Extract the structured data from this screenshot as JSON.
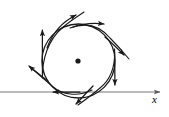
{
  "figure": {
    "title": "",
    "background_color": "#ffffff",
    "stroke_color": "#1a1a1a",
    "width": 169,
    "height": 117
  },
  "axis": {
    "x_label": "x",
    "x_label_position": {
      "x": 152,
      "y": 94
    },
    "line": {
      "x1": 0,
      "y1": 92,
      "x2": 160,
      "y2": 92
    },
    "arrow_tip": {
      "x": 160,
      "y": 92
    },
    "stroke_width": 1
  },
  "equilibrium_point": {
    "name": "center-dot",
    "cx": 78,
    "cy": 61,
    "r": 2.6
  },
  "limit_cycle": {
    "name": "circle",
    "cx": 78.5,
    "cy": 61,
    "rx": 36.5,
    "ry": 37,
    "stroke_width": 1.3
  },
  "trajectories": [
    {
      "name": "arrow-up-left-vertical",
      "direction": "up",
      "path": "M 42.5 74 C 42.3 62 42.4 44 42.4 30",
      "tip": {
        "x": 42.4,
        "y": 24
      },
      "angle_deg": -90
    },
    {
      "name": "arrow-up-right-diagonal",
      "direction": "up-right",
      "path": "M 47 48 C 52 34 62 22 76 15",
      "tip": {
        "x": 85,
        "y": 10
      },
      "angle_deg": -29
    },
    {
      "name": "arrow-right-horizontal-top",
      "direction": "right",
      "path": "M 73 27 C 85 23 95 23 104 24",
      "tip": {
        "x": 113,
        "y": 24
      },
      "angle_deg": 0
    },
    {
      "name": "arrow-down-right-diagonal",
      "direction": "down-right",
      "path": "M 105 37 C 112 43 118 49 124 55",
      "tip": {
        "x": 131,
        "y": 61
      },
      "angle_deg": 41
    },
    {
      "name": "arrow-down-vertical-right",
      "direction": "down",
      "path": "M 114.5 49 C 114.8 62 114.9 76 114.9 85",
      "tip": {
        "x": 114.9,
        "y": 92
      },
      "angle_deg": 90
    },
    {
      "name": "arrow-down-left-diagonal-bottom",
      "direction": "down-left",
      "path": "M 93 86 C 87 92 82 98 76 104",
      "tip": {
        "x": 69,
        "y": 110
      },
      "angle_deg": 139
    },
    {
      "name": "arrow-left-horizontal-axis",
      "direction": "left",
      "path": "M 80 92 C 70 92 60 92 53 92",
      "tip": {
        "x": 45,
        "y": 92
      },
      "angle_deg": 180
    },
    {
      "name": "arrow-up-left-diagonal",
      "direction": "up-left",
      "path": "M 48 81 C 41 76 35 71 29 66",
      "tip": {
        "x": 22.5,
        "y": 60.5
      },
      "angle_deg": -140
    }
  ],
  "spiral_curves": [
    {
      "name": "spiral-arc-upper-left",
      "path": "M 42.4 78 C 42 60 48 40 62 28 C 70 21 78 16 84 12"
    },
    {
      "name": "spiral-arc-upper-right",
      "path": "M 70 28 C 86 22 100 26 110 38 C 118 46 124 53 129 59"
    },
    {
      "name": "spiral-arc-lower-right",
      "path": "M 114.6 52 C 115 68 110 80 100 88 C 92 95 85 100 78 105"
    },
    {
      "name": "spiral-arc-lower-left",
      "path": "M 92 90 C 78 97 62 95 52 86 C 44 79 36 72 30 67"
    }
  ]
}
